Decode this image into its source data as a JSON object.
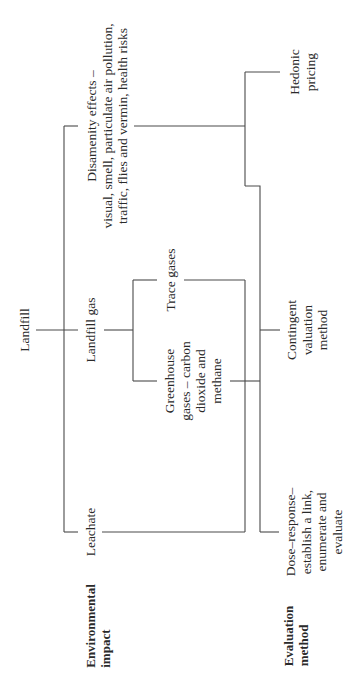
{
  "diagram": {
    "root": "Landfill",
    "row_headers": {
      "environmental_impact": "Environmental\nimpact",
      "evaluation_method": "Evaluation\nmethod"
    },
    "impacts": {
      "disamenity": "Disamenity effects –\nvisual, smell, particulate air pollution,\ntraffic, flies and vermin, health risks",
      "landfill_gas": "Landfill gas",
      "trace_gases": "Trace gases",
      "greenhouse_gases": "Greenhouse\ngases – carbon\ndioxide and\nmethane",
      "leachate": "Leachate"
    },
    "methods": {
      "hedonic": "Hedonic\npricing",
      "contingent": "Contingent\nvaluation\nmethod",
      "dose_response": "Dose–response–\nestablish a link,\nenumerate and\nevaluate"
    },
    "edges": [
      [
        "Landfill",
        "Disamenity effects"
      ],
      [
        "Landfill",
        "Landfill gas"
      ],
      [
        "Landfill",
        "Leachate"
      ],
      [
        "Landfill gas",
        "Trace gases"
      ],
      [
        "Landfill gas",
        "Greenhouse gases"
      ],
      [
        "Disamenity effects",
        "Hedonic pricing"
      ],
      [
        "Disamenity effects",
        "Contingent valuation method"
      ],
      [
        "Greenhouse gases",
        "Contingent valuation method"
      ],
      [
        "Trace gases",
        "Dose–response"
      ],
      [
        "Leachate",
        "Dose–response"
      ]
    ],
    "line_color": "#4a4a4a"
  }
}
